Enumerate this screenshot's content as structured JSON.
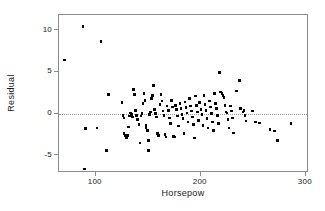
{
  "chart": {
    "type": "scatter",
    "title": "",
    "xlabel": "Horsepow",
    "ylabel": "Residual",
    "ref_line_label": "zero-residual-line"
  },
  "chart_data": {
    "type": "scatter",
    "title": "",
    "xlabel": "Horsepow",
    "ylabel": "Residual",
    "xlim": [
      65,
      303
    ],
    "ylim": [
      -7.1,
      11.8
    ],
    "xticks": [
      100,
      200,
      300
    ],
    "xtick_labels": [
      "100",
      "200",
      "300"
    ],
    "yticks": [
      -5,
      0,
      5,
      10
    ],
    "ytick_labels": [
      "-5",
      "0",
      "5",
      "10"
    ],
    "grid": false,
    "legend": null,
    "annotations": [
      {
        "type": "hline",
        "y": 0,
        "style": "dotted",
        "color": "#9a9a9a"
      }
    ],
    "marker": {
      "shape": "square",
      "color": "#000000",
      "size": 2.6
    },
    "series": [
      {
        "name": "residuals",
        "points": [
          [
            70,
            6.4
          ],
          [
            88,
            10.4
          ],
          [
            105,
            8.6
          ],
          [
            112,
            2.3
          ],
          [
            90,
            -1.8
          ],
          [
            101,
            -1.7
          ],
          [
            110,
            -4.4
          ],
          [
            89,
            -6.6
          ],
          [
            125,
            1.3
          ],
          [
            126,
            -0.2
          ],
          [
            127,
            -0.5
          ],
          [
            127,
            -2.4
          ],
          [
            128,
            -2.6
          ],
          [
            129,
            -2.9
          ],
          [
            130,
            -2.6
          ],
          [
            131,
            -1.6
          ],
          [
            132,
            -0.3
          ],
          [
            133,
            0.1
          ],
          [
            134,
            -0.1
          ],
          [
            135,
            -0.4
          ],
          [
            136,
            2.9
          ],
          [
            137,
            2.3
          ],
          [
            138,
            0.4
          ],
          [
            139,
            -0.2
          ],
          [
            140,
            -0.7
          ],
          [
            141,
            -1.3
          ],
          [
            142,
            -3.5
          ],
          [
            143,
            -0.3
          ],
          [
            144,
            0.0
          ],
          [
            145,
            1.2
          ],
          [
            146,
            2.4
          ],
          [
            147,
            1.6
          ],
          [
            148,
            -1.4
          ],
          [
            148,
            -1.7
          ],
          [
            149,
            -2.0
          ],
          [
            150,
            -3.2
          ],
          [
            150,
            -4.4
          ],
          [
            151,
            -0.1
          ],
          [
            152,
            0.2
          ],
          [
            153,
            1.8
          ],
          [
            154,
            2.2
          ],
          [
            155,
            3.4
          ],
          [
            156,
            0.5
          ],
          [
            157,
            0.0
          ],
          [
            158,
            -0.4
          ],
          [
            159,
            -2.4
          ],
          [
            160,
            -2.6
          ],
          [
            161,
            1.1
          ],
          [
            162,
            2.3
          ],
          [
            163,
            1.5
          ],
          [
            164,
            0.3
          ],
          [
            165,
            -0.2
          ],
          [
            166,
            -2.5
          ],
          [
            167,
            -2.8
          ],
          [
            168,
            0.9
          ],
          [
            169,
            0.4
          ],
          [
            170,
            -0.5
          ],
          [
            171,
            -1.2
          ],
          [
            172,
            1.6
          ],
          [
            173,
            0.8
          ],
          [
            174,
            -2.7
          ],
          [
            175,
            -2.8
          ],
          [
            176,
            1.0
          ],
          [
            177,
            0.5
          ],
          [
            178,
            -0.3
          ],
          [
            179,
            -1.5
          ],
          [
            180,
            1.2
          ],
          [
            181,
            0.6
          ],
          [
            182,
            -0.1
          ],
          [
            183,
            -0.6
          ],
          [
            184,
            -2.4
          ],
          [
            185,
            1.4
          ],
          [
            186,
            0.7
          ],
          [
            187,
            0.1
          ],
          [
            188,
            -1.0
          ],
          [
            189,
            1.8
          ],
          [
            190,
            0.9
          ],
          [
            191,
            0.3
          ],
          [
            192,
            -0.4
          ],
          [
            193,
            -1.3
          ],
          [
            194,
            -2.9
          ],
          [
            195,
            2.1
          ],
          [
            196,
            1.0
          ],
          [
            197,
            0.2
          ],
          [
            198,
            -0.8
          ],
          [
            199,
            1.3
          ],
          [
            200,
            0.5
          ],
          [
            201,
            -0.1
          ],
          [
            202,
            -1.4
          ],
          [
            203,
            2.2
          ],
          [
            204,
            1.1
          ],
          [
            205,
            0.4
          ],
          [
            206,
            -0.6
          ],
          [
            207,
            -1.7
          ],
          [
            208,
            1.5
          ],
          [
            209,
            0.8
          ],
          [
            210,
            0.0
          ],
          [
            211,
            -1.0
          ],
          [
            212,
            -2.0
          ],
          [
            213,
            2.4
          ],
          [
            214,
            1.2
          ],
          [
            215,
            0.6
          ],
          [
            216,
            -0.2
          ],
          [
            217,
            -1.2
          ],
          [
            218,
            4.9
          ],
          [
            219,
            2.6
          ],
          [
            220,
            2.4
          ],
          [
            221,
            2.2
          ],
          [
            222,
            1.9
          ],
          [
            223,
            1.0
          ],
          [
            224,
            0.2
          ],
          [
            225,
            0.1
          ],
          [
            226,
            -0.7
          ],
          [
            227,
            -1.7
          ],
          [
            228,
            0.9
          ],
          [
            229,
            0.3
          ],
          [
            230,
            -0.5
          ],
          [
            231,
            -2.3
          ],
          [
            234,
            2.7
          ],
          [
            237,
            4.0
          ],
          [
            238,
            0.6
          ],
          [
            240,
            0.2
          ],
          [
            241,
            0.4
          ],
          [
            242,
            -0.2
          ],
          [
            243,
            -0.9
          ],
          [
            249,
            0.3
          ],
          [
            252,
            -1.0
          ],
          [
            256,
            -1.1
          ],
          [
            266,
            -1.9
          ],
          [
            270,
            -2.1
          ],
          [
            273,
            -3.2
          ],
          [
            286,
            -1.2
          ]
        ]
      }
    ]
  }
}
